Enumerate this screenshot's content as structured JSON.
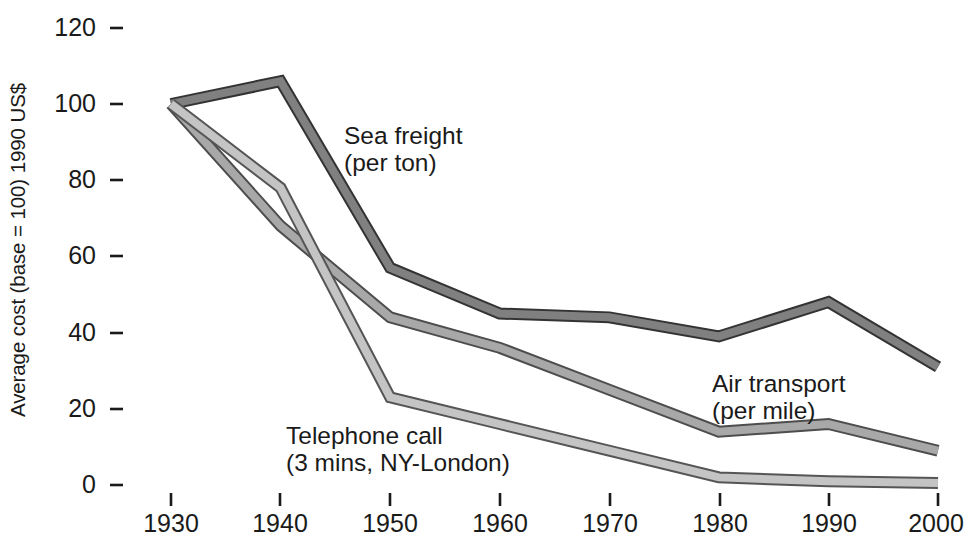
{
  "chart_data": {
    "type": "line",
    "title": "",
    "subtitle": "",
    "xlabel": "",
    "ylabel": "Average cost (base = 100) 1990 US$",
    "x": [
      1930,
      1940,
      1950,
      1960,
      1970,
      1980,
      1990,
      2000
    ],
    "xtick_labels": [
      "1930",
      "1940",
      "1950",
      "1960",
      "1970",
      "1980",
      "1990",
      "2000"
    ],
    "ytick_labels": [
      "0",
      "20",
      "40",
      "60",
      "80",
      "100",
      "120"
    ],
    "yticks": [
      0,
      20,
      40,
      60,
      80,
      100,
      120
    ],
    "ylim": [
      0,
      125
    ],
    "xlim": [
      1927,
      2002
    ],
    "grid": false,
    "legend_position": "inline-annotations",
    "series": [
      {
        "name": "Sea freight",
        "unit_note": "(per ton)",
        "color": "#808080",
        "outline": "#333333",
        "values": [
          100,
          106,
          57,
          45,
          44,
          39,
          48,
          31
        ],
        "annotation": {
          "line1": "Sea freight",
          "line2": "(per ton)"
        }
      },
      {
        "name": "Air transport",
        "unit_note": "(per mile)",
        "color": "#a8a8a8",
        "outline": "#4d4d4d",
        "values": [
          100,
          68,
          44,
          36,
          25,
          14,
          16,
          9
        ],
        "annotation": {
          "line1": "Air transport",
          "line2": "(per mile)"
        }
      },
      {
        "name": "Telephone call",
        "unit_note": "(3 mins, NY-London)",
        "color": "#c4c4c4",
        "outline": "#555555",
        "values": [
          100,
          78,
          23,
          16,
          9,
          2,
          1,
          0.5
        ],
        "annotation": {
          "line1": "Telephone call",
          "line2": "(3 mins, NY-London)"
        }
      }
    ]
  },
  "axis": {
    "y_label": "Average cost (base = 100) 1990 US$",
    "y_ticks": {
      "t0": "0",
      "t20": "20",
      "t40": "40",
      "t60": "60",
      "t80": "80",
      "t100": "100",
      "t120": "120"
    },
    "x_ticks": {
      "t1930": "1930",
      "t1940": "1940",
      "t1950": "1950",
      "t1960": "1960",
      "t1970": "1970",
      "t1980": "1980",
      "t1990": "1990",
      "t2000": "2000"
    }
  },
  "annotations": {
    "sea_freight_l1": "Sea freight",
    "sea_freight_l2": "(per ton)",
    "air_transport_l1": "Air transport",
    "air_transport_l2": "(per mile)",
    "telephone_l1": "Telephone call",
    "telephone_l2": "(3 mins, NY-London)"
  },
  "colors": {
    "sea_freight": "#808080",
    "air_transport": "#a8a8a8",
    "telephone": "#c4c4c4",
    "axis_text": "#1a1a1a",
    "background": "#ffffff"
  }
}
